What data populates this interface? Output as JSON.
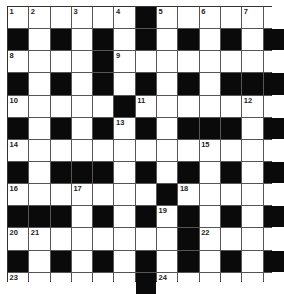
{
  "puzzle": {
    "rows": 13,
    "cols": 13,
    "grid": [
      "......#......",
      "#.#.#.#.#.#.#",
      "....#........",
      "#.#.#.#.#.###",
      ".....#.......",
      "#.#.#.#.###.#",
      ".............",
      "#.###.#.#.#.#",
      ".......#.....",
      "###.#.#.#.#.#",
      "........#....",
      "#.#.#.#.#.#.#",
      "......#......"
    ],
    "numbers": [
      {
        "r": 0,
        "c": 0,
        "n": "1"
      },
      {
        "r": 0,
        "c": 1,
        "n": "2"
      },
      {
        "r": 0,
        "c": 3,
        "n": "3"
      },
      {
        "r": 0,
        "c": 5,
        "n": "4"
      },
      {
        "r": 0,
        "c": 7,
        "n": "5"
      },
      {
        "r": 0,
        "c": 9,
        "n": "6"
      },
      {
        "r": 0,
        "c": 11,
        "n": "7"
      },
      {
        "r": 2,
        "c": 0,
        "n": "8"
      },
      {
        "r": 2,
        "c": 5,
        "n": "9"
      },
      {
        "r": 4,
        "c": 0,
        "n": "10"
      },
      {
        "r": 4,
        "c": 6,
        "n": "11"
      },
      {
        "r": 4,
        "c": 11,
        "n": "12"
      },
      {
        "r": 5,
        "c": 5,
        "n": "13"
      },
      {
        "r": 6,
        "c": 0,
        "n": "14"
      },
      {
        "r": 6,
        "c": 9,
        "n": "15"
      },
      {
        "r": 8,
        "c": 0,
        "n": "16"
      },
      {
        "r": 8,
        "c": 3,
        "n": "17"
      },
      {
        "r": 8,
        "c": 8,
        "n": "18"
      },
      {
        "r": 9,
        "c": 7,
        "n": "19"
      },
      {
        "r": 10,
        "c": 0,
        "n": "20"
      },
      {
        "r": 10,
        "c": 1,
        "n": "21"
      },
      {
        "r": 10,
        "c": 9,
        "n": "22"
      },
      {
        "r": 12,
        "c": 0,
        "n": "23"
      },
      {
        "r": 12,
        "c": 7,
        "n": "24"
      }
    ]
  }
}
